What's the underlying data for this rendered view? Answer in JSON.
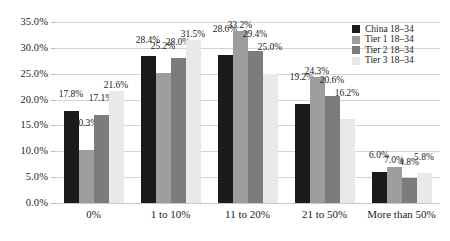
{
  "chart_data": {
    "type": "bar",
    "title": "",
    "xlabel": "",
    "ylabel": "",
    "ylim": [
      0,
      35
    ],
    "grid": true,
    "legend_position": "top-right",
    "ytick_labels": [
      "35.0%",
      "30.0%",
      "25.0%",
      "20.0%",
      "15.0%",
      "10.0%",
      "5.0%",
      "0.0%"
    ],
    "ytick_values": [
      35,
      30,
      25,
      20,
      15,
      10,
      5,
      0
    ],
    "categories": [
      "0%",
      "1 to 10%",
      "11 to 20%",
      "21 to 50%",
      "More than 50%"
    ],
    "series": [
      {
        "name": "China 18–34",
        "color": "#1a1a1a",
        "values": [
          17.8,
          28.4,
          28.6,
          19.2,
          6.0
        ],
        "labels": [
          "17.8%",
          "28.4%",
          "28.6%",
          "19.2%",
          "6.0%"
        ]
      },
      {
        "name": "Tier 1 18–34",
        "color": "#9d9d9d",
        "values": [
          10.3,
          25.2,
          33.2,
          24.3,
          7.0
        ],
        "labels": [
          "10.3%",
          "25.2%",
          "33.2%",
          "24.3%",
          "7.0%"
        ]
      },
      {
        "name": "Tier 2 18–34",
        "color": "#7c7c7c",
        "values": [
          17.1,
          28.0,
          29.4,
          20.6,
          4.8
        ],
        "labels": [
          "17.1%",
          "28.0%",
          "29.4%",
          "20.6%",
          "4.8%"
        ]
      },
      {
        "name": "Tier 3 18–34",
        "color": "#e9e9e9",
        "values": [
          21.6,
          31.5,
          25.0,
          16.2,
          5.8
        ],
        "labels": [
          "21.6%",
          "31.5%",
          "25.0%",
          "16.2%",
          "5.8%"
        ]
      }
    ]
  }
}
